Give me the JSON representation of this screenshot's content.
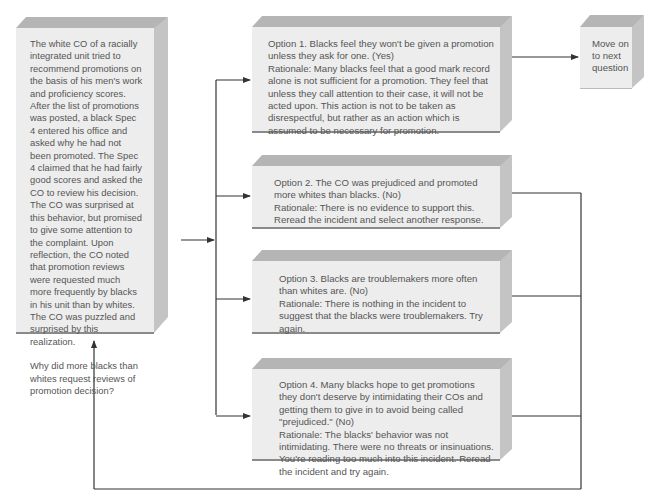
{
  "scenario": {
    "text": "The white CO of a racially integrated unit tried to recommend promotions on the basis of his men's work and proficiency scores.  After the list of promotions was posted, a black Spec 4 entered his office and asked why he had not been promoted.  The Spec 4 claimed that he had fairly good scores and asked the CO to review his decision.  The CO was surprised at this behavior, but promised to give some attention to the complaint.  Upon reflection, the CO noted that promotion reviews were requested much more frequently by blacks in his unit than by whites.  The CO was puzzled and surprised by this realization.",
    "question": "Why did more blacks than whites request reviews of promotion decision?"
  },
  "options": [
    {
      "label": "Option 1.  Blacks feel they won't be given a promotion unless they ask for one.  (Yes)",
      "rationale": "Rationale:  Many blacks feel that a good mark record alone is not sufficient for a promotion. They feel that unless they call attention to their case, it will not be acted upon.  This action is not to be taken as disrespectful, but rather as an action which is assumed to be necessary for promotion.",
      "correct": true
    },
    {
      "label": "Option 2.  The CO was prejudiced and promoted more whites than blacks.  (No)",
      "rationale": "Rationale:  There is no evidence to support this. Reread the incident and select another response.",
      "correct": false
    },
    {
      "label": "Option 3.  Blacks are troublemakers more often than whites are.  (No)",
      "rationale": "Rationale:  There is nothing in the incident to suggest that the blacks were troublemakers. Try again.",
      "correct": false
    },
    {
      "label": "Option 4.  Many blacks hope to get promotions they don't deserve by intimidating their COs and getting them to give in to avoid being called \"prejudiced.\"  (No)",
      "rationale": "Rationale:  The blacks' behavior was not intimidating.  There were no threats or insinuations.  You're reading too much into this incident.  Reread the incident and try again.",
      "correct": false
    }
  ],
  "next": {
    "text": "Move on to next question"
  },
  "colors": {
    "box_front": "#ededed",
    "box_top": "#b5b5b5",
    "box_side": "#c4c4c4",
    "line": "#333333",
    "text": "#555555"
  }
}
